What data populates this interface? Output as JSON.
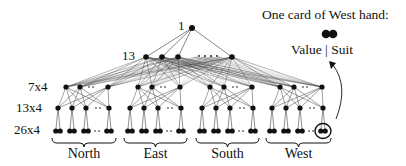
{
  "diagram": {
    "level_labels": [
      {
        "text": "1",
        "x": 178,
        "y": 19
      },
      {
        "text": "13",
        "x": 122,
        "y": 50
      },
      {
        "text": "7x4",
        "x": 28,
        "y": 81
      },
      {
        "text": "13x4",
        "x": 16,
        "y": 102
      },
      {
        "text": "26x4",
        "x": 14,
        "y": 124
      }
    ],
    "ellipsis": "....",
    "groups": [
      {
        "name": "North",
        "x0": 52,
        "x1": 116
      },
      {
        "name": "East",
        "x0": 124,
        "x1": 187
      },
      {
        "name": "South",
        "x0": 196,
        "x1": 259
      },
      {
        "name": "West",
        "x0": 266,
        "x1": 331
      }
    ],
    "legend": {
      "title": "One card of West hand:",
      "caption": "Value | Suit"
    },
    "colors": {
      "node": "#111111",
      "edge": "#333333",
      "text": "#111111"
    }
  }
}
